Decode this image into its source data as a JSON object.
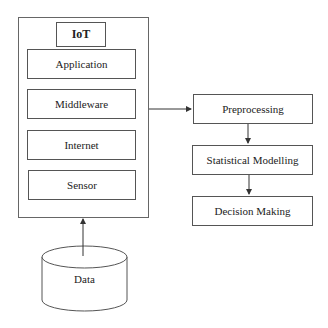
{
  "diagram": {
    "iot_stack": {
      "title": "IoT",
      "layers": [
        "Application",
        "Middleware",
        "Internet",
        "Sensor"
      ]
    },
    "data_source": {
      "label": "Data"
    },
    "pipeline": {
      "steps": [
        "Preprocessing",
        "Statistical Modelling",
        "Decision Making"
      ]
    },
    "colors": {
      "stroke": "#555555",
      "background": "#ffffff",
      "text": "#222222"
    }
  }
}
